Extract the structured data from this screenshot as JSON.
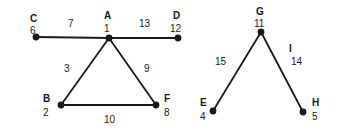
{
  "diagram": {
    "type": "undirected-graph",
    "background_color": "#ffffff",
    "stroke_color": "#1a1a1a",
    "nodes": [
      {
        "name": "C",
        "number": "6",
        "x": 36,
        "y": 37,
        "name_x": 30,
        "name_y": 14,
        "num_x": 30,
        "num_y": 26
      },
      {
        "name": "A",
        "number": "1",
        "x": 109,
        "y": 38,
        "name_x": 104,
        "name_y": 11,
        "num_x": 104,
        "num_y": 24
      },
      {
        "name": "D",
        "number": "12",
        "x": 178,
        "y": 38,
        "name_x": 173,
        "name_y": 11,
        "num_x": 170,
        "num_y": 24
      },
      {
        "name": "B",
        "number": "2",
        "x": 61,
        "y": 105,
        "name_x": 43,
        "name_y": 94,
        "num_x": 43,
        "num_y": 108
      },
      {
        "name": "F",
        "number": "8",
        "x": 156,
        "y": 105,
        "name_x": 164,
        "name_y": 94,
        "num_x": 164,
        "num_y": 108
      },
      {
        "name": "G",
        "number": "11",
        "x": 261,
        "y": 32,
        "name_x": 256,
        "name_y": 7,
        "num_x": 254,
        "num_y": 19
      },
      {
        "name": "E",
        "number": "4",
        "x": 213,
        "y": 111,
        "name_x": 200,
        "name_y": 98,
        "num_x": 200,
        "num_y": 112
      },
      {
        "name": "H",
        "number": "5",
        "x": 303,
        "y": 112,
        "name_x": 312,
        "name_y": 98,
        "num_x": 312,
        "num_y": 112
      }
    ],
    "edges": [
      {
        "id": "C-A",
        "from": "C",
        "to": "A",
        "weight": "7",
        "label": "",
        "weight_x": 68,
        "weight_y": 19
      },
      {
        "id": "A-D",
        "from": "A",
        "to": "D",
        "weight": "13",
        "label": "",
        "weight_x": 139,
        "weight_y": 19
      },
      {
        "id": "A-B",
        "from": "A",
        "to": "B",
        "weight": "3",
        "label": "",
        "weight_x": 64,
        "weight_y": 64
      },
      {
        "id": "A-F",
        "from": "A",
        "to": "F",
        "weight": "9",
        "label": "",
        "weight_x": 144,
        "weight_y": 64
      },
      {
        "id": "B-F",
        "from": "B",
        "to": "F",
        "weight": "10",
        "label": "",
        "weight_x": 104,
        "weight_y": 115
      },
      {
        "id": "E-G",
        "from": "E",
        "to": "G",
        "weight": "15",
        "label": "",
        "weight_x": 215,
        "weight_y": 57
      },
      {
        "id": "G-H",
        "from": "G",
        "to": "H",
        "weight": "14",
        "label": "I",
        "weight_x": 291,
        "weight_y": 57,
        "label_x": 289,
        "label_y": 44
      }
    ]
  }
}
